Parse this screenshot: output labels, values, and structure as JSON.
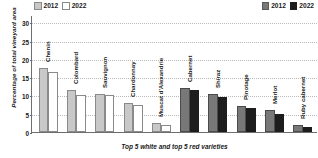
{
  "legend_left": {
    "items": [
      {
        "label": "2012",
        "key": "w12"
      },
      {
        "label": "2022",
        "key": "w22"
      }
    ]
  },
  "legend_right": {
    "items": [
      {
        "label": "2012",
        "key": "r12"
      },
      {
        "label": "2022",
        "key": "r22"
      }
    ]
  },
  "axis": {
    "ylabel": "Percentage of total vineyard area",
    "xlabel": "Top 5 white and top 5 red varieties",
    "yticks": [
      "0",
      "5",
      "10",
      "15",
      "20",
      "25",
      "30"
    ]
  },
  "colors": {
    "white_2012": "#c8c8c8",
    "white_2022": "#ffffff",
    "red_2012": "#787878",
    "red_2022": "#1d1d1d",
    "axis": "#6e6e6e",
    "grid": "#b9b9b9"
  },
  "chart_data": {
    "type": "bar",
    "title": "",
    "xlabel": "Top 5 white and top 5 red varieties",
    "ylabel": "Percentage of total vineyard area",
    "ylim": [
      0,
      32
    ],
    "yticks": [
      0,
      5,
      10,
      15,
      20,
      25,
      30
    ],
    "grid": true,
    "legend_position": "top-left and top-right",
    "categories": [
      "Chenin",
      "Colombard",
      "Sauvignon",
      "Chardonnay",
      "Muscat d'Alexandrie",
      "Cabernet",
      "Shiraz",
      "Pinotage",
      "Merlot",
      "Ruby cabernet"
    ],
    "group": [
      "white",
      "white",
      "white",
      "white",
      "white",
      "red",
      "red",
      "red",
      "red",
      "red"
    ],
    "series": [
      {
        "name": "2012",
        "values": [
          17.5,
          11.5,
          10.5,
          8.0,
          2.5,
          12.0,
          10.5,
          7.0,
          6.0,
          2.0
        ]
      },
      {
        "name": "2022",
        "values": [
          16.5,
          10.0,
          10.0,
          7.5,
          2.0,
          11.5,
          9.5,
          6.5,
          5.0,
          1.5
        ]
      }
    ]
  }
}
